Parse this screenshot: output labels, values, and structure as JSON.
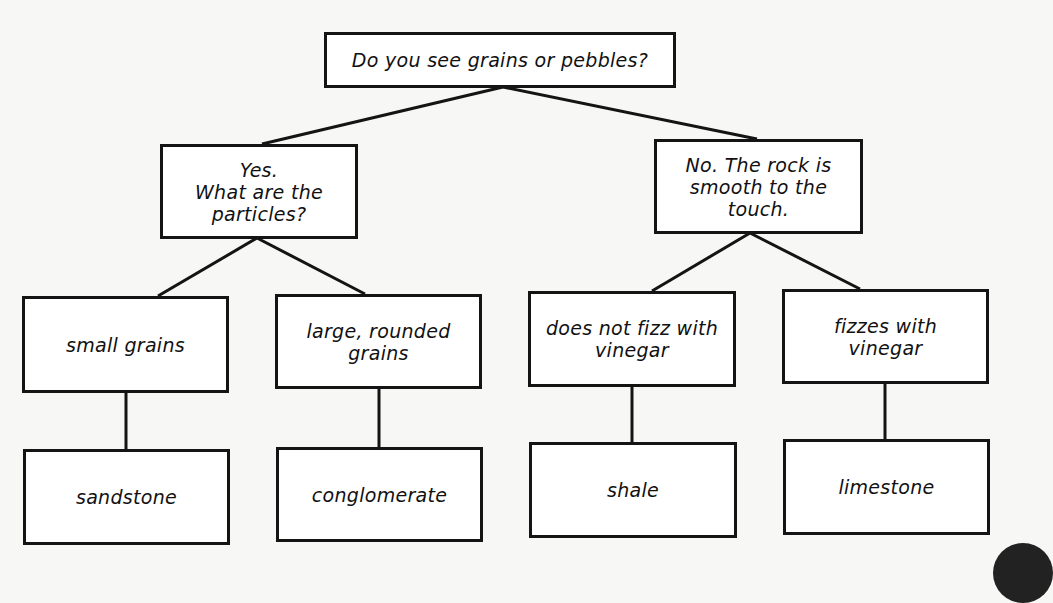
{
  "diagram": {
    "type": "decision-tree",
    "topic": "sedimentary rock identification",
    "nodes": {
      "root": "Do you see grains or pebbles?",
      "yes": "Yes.\nWhat are the\nparticles?",
      "no": "No. The rock is\nsmooth to the\ntouch.",
      "small_grains": "small grains",
      "large_grains": "large, rounded\ngrains",
      "no_fizz": "does not fizz with\nvinegar",
      "fizz": "fizzes with\nvinegar",
      "sandstone": "sandstone",
      "conglomerate": "conglomerate",
      "shale": "shale",
      "limestone": "limestone"
    },
    "edges": [
      [
        "root",
        "yes"
      ],
      [
        "root",
        "no"
      ],
      [
        "yes",
        "small_grains"
      ],
      [
        "yes",
        "large_grains"
      ],
      [
        "no",
        "no_fizz"
      ],
      [
        "no",
        "fizz"
      ],
      [
        "small_grains",
        "sandstone"
      ],
      [
        "large_grains",
        "conglomerate"
      ],
      [
        "no_fizz",
        "shale"
      ],
      [
        "fizz",
        "limestone"
      ]
    ],
    "colors": {
      "line": "#141414",
      "box_fill": "#ffffff",
      "background": "#f7f7f6"
    }
  }
}
